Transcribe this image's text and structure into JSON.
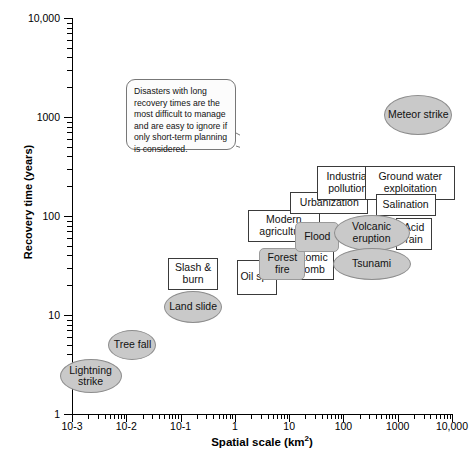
{
  "chart_data": {
    "type": "scatter",
    "title": "",
    "xlabel": "Spatial scale (km2)",
    "ylabel": "Recovery time (years)",
    "xscale": "log",
    "yscale": "log",
    "xlim": [
      0.001,
      10000
    ],
    "ylim": [
      1,
      10000
    ],
    "grid": false,
    "legend": "none",
    "xticklabels": [
      "10-3",
      "10-2",
      "10-1",
      "1",
      "10",
      "100",
      "1000",
      "10,000"
    ],
    "yticklabels": [
      "1",
      "10",
      "100",
      "1000",
      "10,000"
    ],
    "annotations": [
      {
        "name": "callout",
        "text": "Disasters with long recovery times are the most difficult to manage and are easy to ignore if only short-term planning is considered."
      }
    ],
    "points": [
      {
        "label": "Lightning strike",
        "shape": "ellipse",
        "x": 0.0022,
        "y": 2.4
      },
      {
        "label": "Tree fall",
        "shape": "ellipse",
        "x": 0.013,
        "y": 5.0
      },
      {
        "label": "Land slide",
        "shape": "ellipse",
        "x": 0.17,
        "y": 12
      },
      {
        "label": "Slash & burn",
        "shape": "rect",
        "x": 0.17,
        "y": 26
      },
      {
        "label": "Oil spill",
        "shape": "rect",
        "x": 2.6,
        "y": 24
      },
      {
        "label": "Forest fire",
        "shape": "round-rect",
        "x": 7.5,
        "y": 33
      },
      {
        "label": "Atomic bomb",
        "shape": "rect",
        "x": 26,
        "y": 33
      },
      {
        "label": "Flood",
        "shape": "round-rect",
        "x": 33,
        "y": 62
      },
      {
        "label": "Modern agriculture",
        "shape": "rect",
        "x": 8,
        "y": 80
      },
      {
        "label": "Tsunami",
        "shape": "ellipse",
        "x": 330,
        "y": 33
      },
      {
        "label": "Volcanic eruption",
        "shape": "ellipse",
        "x": 330,
        "y": 68
      },
      {
        "label": "Acid rain",
        "shape": "rect",
        "x": 2000,
        "y": 66
      },
      {
        "label": "Urbanization",
        "shape": "rect",
        "x": 55,
        "y": 135
      },
      {
        "label": "Salination",
        "shape": "rect",
        "x": 1400,
        "y": 130
      },
      {
        "label": "Industrial pollution",
        "shape": "rect",
        "x": 120,
        "y": 215
      },
      {
        "label": "Ground water exploitation",
        "shape": "rect",
        "x": 1700,
        "y": 215
      },
      {
        "label": "Meteor strike",
        "shape": "ellipse",
        "x": 2400,
        "y": 1050
      }
    ]
  },
  "nodes": {
    "lightning_strike": "Lightning\nstrike",
    "tree_fall": "Tree\nfall",
    "land_slide": "Land\nslide",
    "slash_burn": "Slash\n& burn",
    "oil_spill": "Oil\nspill",
    "forest_fire": "Forest\nfire",
    "atomic_bomb": "Atomic\nbomb",
    "flood": "Flood",
    "modern_agriculture": "Modern\nagriculture",
    "tsunami": "Tsunami",
    "volcanic_eruption": "Volcanic\neruption",
    "acid_rain": "Acid\nrain",
    "urbanization": "Urbanization",
    "salination": "Salination",
    "industrial_pollution": "Industrial\npollution",
    "ground_water": "Ground water\nexploitation",
    "meteor_strike": "Meteor\nstrike"
  },
  "axes": {
    "y_title": "Recovery time (years)",
    "x_title_main": "Spatial scale (km",
    "x_title_sup": "2",
    "x_title_end": ")",
    "y_labels": [
      "10,000",
      "1000",
      "100",
      "10",
      "1"
    ],
    "x_labels": [
      "10-3",
      "10-2",
      "10-1",
      "1",
      "10",
      "100",
      "1000",
      "10,000"
    ]
  },
  "callout": {
    "text": "Disasters with long recovery times are the most difficult to manage and are easy to ignore if only short-term planning is considered."
  }
}
